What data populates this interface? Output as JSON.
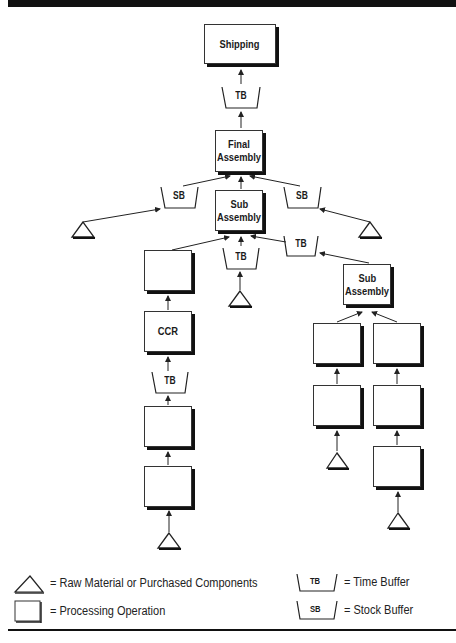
{
  "diagram": {
    "nodes": {
      "shipping": "Shipping",
      "final_assembly": [
        "Final",
        "Assembly"
      ],
      "sub_assembly_center": [
        "Sub",
        "Assembly"
      ],
      "sub_assembly_right": [
        "Sub",
        "Assembly"
      ],
      "ccr": "CCR"
    },
    "buffers": {
      "tb_shipping": "TB",
      "sb_left": "SB",
      "sb_right": "SB",
      "tb_center": "TB",
      "tb_right": "TB",
      "tb_ccr": "TB"
    }
  },
  "legend": {
    "triangle": "= Raw Material or Purchased Components",
    "square": "= Processing Operation",
    "tb_symbol": "TB",
    "tb": "= Time Buffer",
    "sb_symbol": "SB",
    "sb": "= Stock Buffer"
  }
}
